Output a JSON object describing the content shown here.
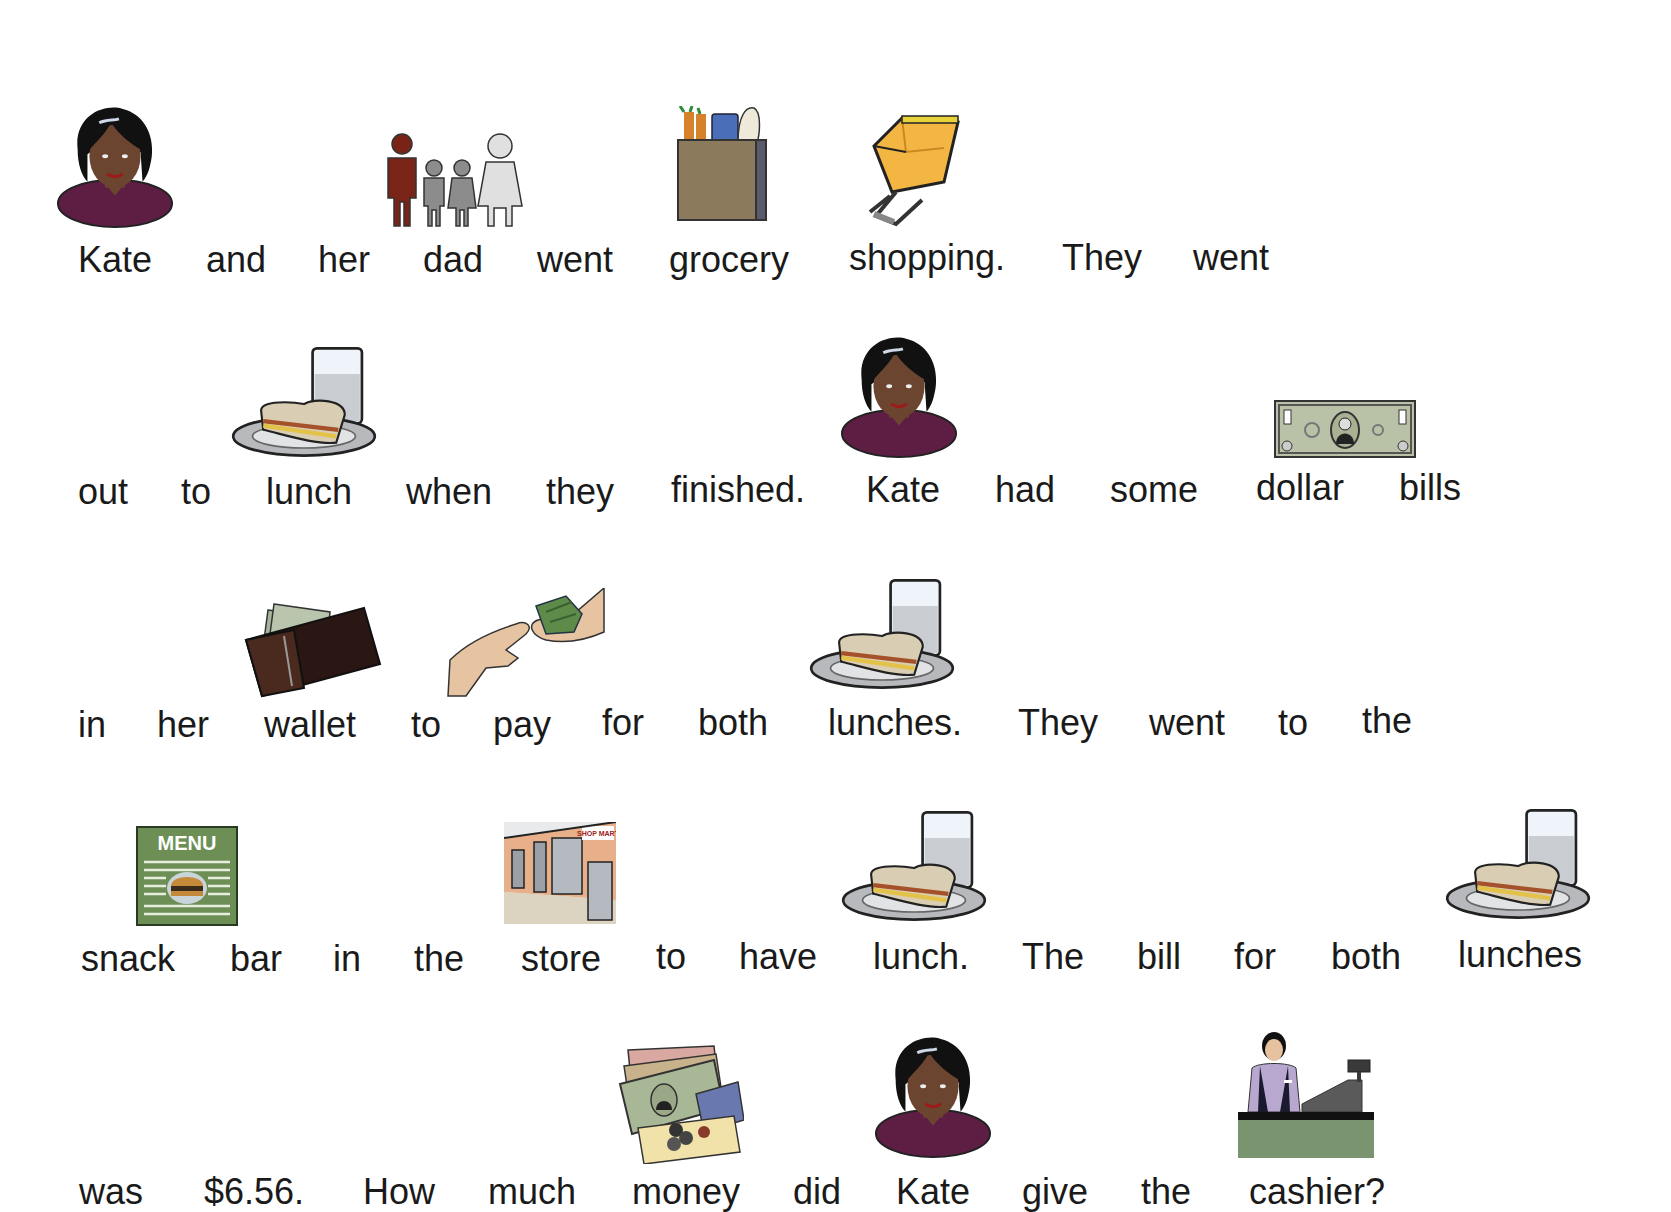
{
  "story": {
    "rows": [
      {
        "words": [
          "Kate",
          "and",
          "her",
          "dad",
          "went",
          "grocery",
          "shopping.",
          "They",
          "went"
        ]
      },
      {
        "words": [
          "out",
          "to",
          "lunch",
          "when",
          "they",
          "finished.",
          "Kate",
          "had",
          "some",
          "dollar",
          "bills"
        ]
      },
      {
        "words": [
          "in",
          "her",
          "wallet",
          "to",
          "pay",
          "for",
          "both",
          "lunches.",
          "They",
          "went",
          "to",
          "the"
        ]
      },
      {
        "words": [
          "snack",
          "bar",
          "in",
          "the",
          "store",
          "to",
          "have",
          "lunch.",
          "The",
          "bill",
          "for",
          "both",
          "lunches"
        ]
      },
      {
        "words": [
          "was",
          "$6.56.",
          "How",
          "much",
          "money",
          "did",
          "Kate",
          "give",
          "the",
          "cashier?"
        ]
      }
    ]
  },
  "pictures": {
    "kate": "person-kate-icon",
    "family": "family-icon",
    "grocery": "grocery-bag-icon",
    "shopping": "shopping-cart-icon",
    "lunch": "lunch-sandwich-milk-icon",
    "dollar": "dollar-bill-icon",
    "wallet": "wallet-icon",
    "pay": "pay-hands-money-icon",
    "menu": "menu-snack-bar-icon",
    "menu_label": "MENU",
    "store": "store-front-icon",
    "store_sign": "SHOP MART",
    "money": "money-cash-cards-icon",
    "cashier": "cashier-register-icon"
  }
}
